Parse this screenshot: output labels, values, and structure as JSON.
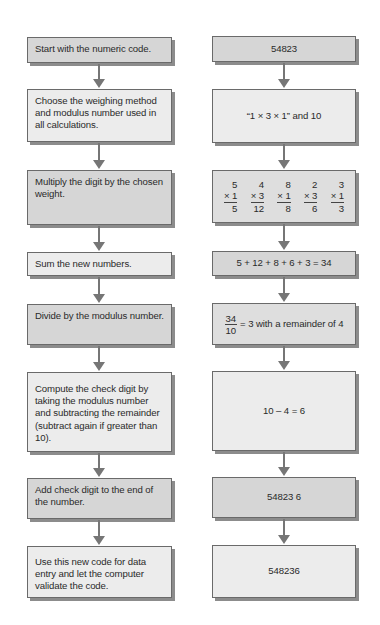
{
  "diagram": {
    "left_steps": [
      "Start with the numeric code.",
      "Choose the weighing method and modulus number used in all calculations.",
      "Multiply the digit by the chosen weight.",
      "Sum the new numbers.",
      "Divide by the modulus number.",
      "Compute the check digit by taking the modulus number and subtracting the remainder (subtract again if greater than 10).",
      "Add check digit to the end of the number.",
      "Use this new code for data entry and let the computer validate the code."
    ],
    "right_values": {
      "code": "54823",
      "method": "“1 × 3 × 1” and 10",
      "multiplication": [
        {
          "digit": "5",
          "weight": "× 1",
          "result": "5"
        },
        {
          "digit": "4",
          "weight": "× 3",
          "result": "12"
        },
        {
          "digit": "8",
          "weight": "× 1",
          "result": "8"
        },
        {
          "digit": "2",
          "weight": "× 3",
          "result": "6"
        },
        {
          "digit": "3",
          "weight": "× 1",
          "result": "3"
        }
      ],
      "sum": "5 + 12 + 8 + 6 + 3 = 34",
      "division": {
        "numerator": "34",
        "denominator": "10",
        "rest": "= 3 with a remainder of 4"
      },
      "subtraction": "10 – 4 = 6",
      "appended": "54823 6",
      "final": "548236"
    },
    "colors": {
      "box_border": "#6a6a6a",
      "box_shadow": "#8c8c8c",
      "box_fill_dark": "#d6d6d6",
      "box_fill_light": "#ececec",
      "arrow": "#767676"
    }
  }
}
